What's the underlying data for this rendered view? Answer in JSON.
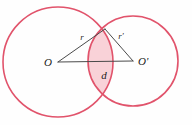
{
  "figure": {
    "background_color": "#fefefe",
    "stroke_color": "#e1536b",
    "lens_fill_color": "#f9d2d8",
    "line_color": "#4a4a4a",
    "label_color": "#1a1a1a"
  },
  "labels": {
    "center_left": "O",
    "center_right": "O'",
    "radius_left": "r",
    "radius_right": "r'",
    "center_distance": "d"
  },
  "chart_data": {
    "type": "diagram",
    "subtitle": "",
    "xlabel": "",
    "ylabel": "",
    "grid": false,
    "legend": null,
    "shapes": [
      {
        "name": "left-circle",
        "kind": "circle",
        "center_x": 58,
        "center_y": 62,
        "radius": 55,
        "stroke": "#e1536b",
        "fill": "none"
      },
      {
        "name": "right-circle",
        "kind": "circle",
        "center_x": 133,
        "center_y": 61,
        "radius": 45,
        "stroke": "#e1536b",
        "fill": "none"
      },
      {
        "name": "lens-intersection",
        "kind": "lens",
        "fill": "#f9d2d8",
        "stroke": "none"
      }
    ],
    "points": [
      {
        "name": "O",
        "label": "O",
        "x": 58,
        "y": 62
      },
      {
        "name": "O-prime",
        "label": "O'",
        "x": 133,
        "y": 61
      },
      {
        "name": "upper-intersection",
        "label": "",
        "x": 105,
        "y": 29
      },
      {
        "name": "lower-intersection",
        "label": "",
        "x": 105,
        "y": 94
      }
    ],
    "segments": [
      {
        "name": "radius-left-segment",
        "label": "r",
        "from": "O",
        "to": "upper-intersection",
        "label_x": 82,
        "label_y": 40
      },
      {
        "name": "radius-right-segment",
        "label": "r'",
        "from": "O-prime",
        "to": "upper-intersection",
        "label_x": 121,
        "label_y": 39
      },
      {
        "name": "center-distance-segment",
        "label": "d",
        "from": "O",
        "to": "O-prime",
        "label_x": 104,
        "label_y": 78
      }
    ],
    "annotations": [
      {
        "text": "O",
        "x": 52,
        "y": 66
      },
      {
        "text": "O'",
        "x": 137,
        "y": 65
      },
      {
        "text": "r",
        "x": 82,
        "y": 40
      },
      {
        "text": "r'",
        "x": 121,
        "y": 39
      },
      {
        "text": "d",
        "x": 104,
        "y": 78
      }
    ]
  }
}
